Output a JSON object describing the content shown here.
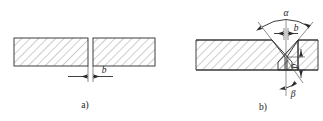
{
  "figure": {
    "title_present": false,
    "background_color": "#ffffff",
    "line_color": "#2a2a2a",
    "hatch_color": "#4a4a4a",
    "subfigures": [
      {
        "id": "a",
        "caption": "a)",
        "description": "square-butt joint, two plates with gap",
        "labels": [
          {
            "name": "gap",
            "symbol": "b"
          }
        ]
      },
      {
        "id": "b",
        "caption": "b)",
        "description": "single-V groove butt joint with root face",
        "labels": [
          {
            "name": "groove-angle",
            "symbol": "α"
          },
          {
            "name": "bevel-angle",
            "symbol": "β"
          },
          {
            "name": "root-gap",
            "symbol": "b"
          },
          {
            "name": "root-face",
            "symbol": "p"
          }
        ]
      }
    ]
  },
  "symbols": {
    "alpha": "α",
    "beta": "β",
    "b": "b",
    "p": "p",
    "caption_a": "a)",
    "caption_b": "b)"
  }
}
